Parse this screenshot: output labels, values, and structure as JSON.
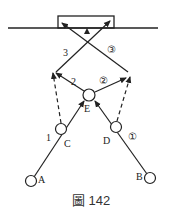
{
  "caption": "圖 142",
  "labels": {
    "A": "A",
    "B": "B",
    "C": "C",
    "D": "D",
    "E": "E",
    "path_left_1": "1",
    "path_left_2": "2",
    "path_left_3": "3",
    "path_right_1": "①",
    "path_right_2": "②",
    "path_right_3": "③"
  },
  "colors": {
    "stroke": "#222222",
    "background": "#ffffff"
  }
}
